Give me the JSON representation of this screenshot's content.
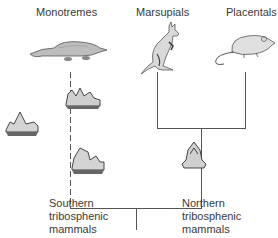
{
  "diagram": {
    "groups": {
      "monotremes": "Monotremes",
      "marsupials": "Marsupials",
      "placentals": "Placentals"
    },
    "ancestors": {
      "southern": [
        "Southern",
        "tribosphenic",
        "mammals"
      ],
      "northern": [
        "Northern",
        "tribosphenic",
        "mammals"
      ]
    },
    "icons": {
      "monotreme": "platypus-illustration",
      "marsupial": "kangaroo-illustration",
      "placental": "rat-illustration",
      "southern_teeth": "fossil-molar-teeth",
      "northern_tooth": "fossil-molar-tooth"
    }
  }
}
